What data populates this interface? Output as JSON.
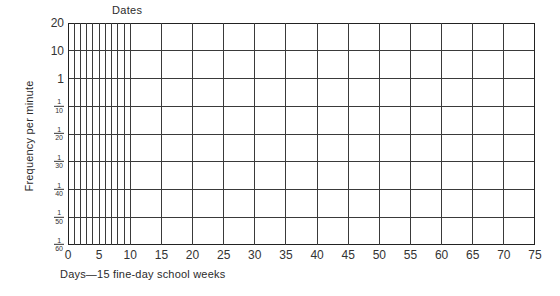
{
  "chart_data": {
    "type": "line",
    "title": "Dates",
    "xlabel": "Days—15 fine-day school weeks",
    "ylabel": "Frequency per minute",
    "grid": true,
    "legend": "none",
    "series": [],
    "x": [],
    "xlim": [
      0,
      75
    ],
    "x_tick_labels": [
      "0",
      "5",
      "10",
      "15",
      "20",
      "25",
      "30",
      "35",
      "40",
      "45",
      "50",
      "55",
      "60",
      "65",
      "70",
      "75"
    ],
    "x_tick_values": [
      0,
      5,
      10,
      15,
      20,
      25,
      30,
      35,
      40,
      45,
      50,
      55,
      60,
      65,
      70,
      75
    ],
    "x_minor_gridlines": [
      0,
      1,
      2,
      3,
      4,
      5,
      6,
      7,
      8,
      9,
      10
    ],
    "x_major_gridlines": [
      0,
      5,
      10,
      15,
      20,
      25,
      30,
      35,
      40,
      45,
      50,
      55,
      60,
      65,
      70,
      75
    ],
    "y_scale": "celeration-log",
    "y_tick_labels": [
      "20",
      "10",
      "1",
      "1/10",
      "1/20",
      "1/30",
      "1/40",
      "1/50",
      "1/60"
    ],
    "y_tick_plain": [
      "20",
      "10",
      "1"
    ],
    "y_tick_fractions": [
      {
        "num": "1",
        "den": "10"
      },
      {
        "num": "1",
        "den": "20"
      },
      {
        "num": "1",
        "den": "30"
      },
      {
        "num": "1",
        "den": "40"
      },
      {
        "num": "1",
        "den": "50"
      },
      {
        "num": "1",
        "den": "60"
      }
    ],
    "ylim_labels": [
      "20",
      "1/60"
    ],
    "colors": {
      "grid_line": "#3a3a3a",
      "axis_line": "#222222",
      "text": "#2b2b2b",
      "background": "#ffffff"
    }
  }
}
